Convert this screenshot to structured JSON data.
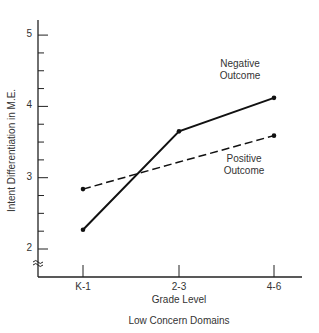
{
  "chart_data": {
    "type": "line",
    "title": "Low Concern Domains",
    "xlabel": "Grade Level",
    "ylabel": "Intent Differentiation in M.E.",
    "categories": [
      "K-1",
      "2-3",
      "4-6"
    ],
    "yticks": [
      "2",
      "3",
      "4",
      "5"
    ],
    "ylim": [
      1.6,
      5.2
    ],
    "axis_break": true,
    "grid": false,
    "series": [
      {
        "name": "Negative Outcome",
        "label_line1": "Negative",
        "label_line2": "Outcome",
        "style": "solid",
        "values": [
          2.27,
          3.65,
          4.12
        ]
      },
      {
        "name": "Positive Outcome",
        "label_line1": "Positive",
        "label_line2": "Outcome",
        "style": "dashed",
        "values": [
          2.84,
          3.22,
          3.59
        ]
      }
    ]
  }
}
